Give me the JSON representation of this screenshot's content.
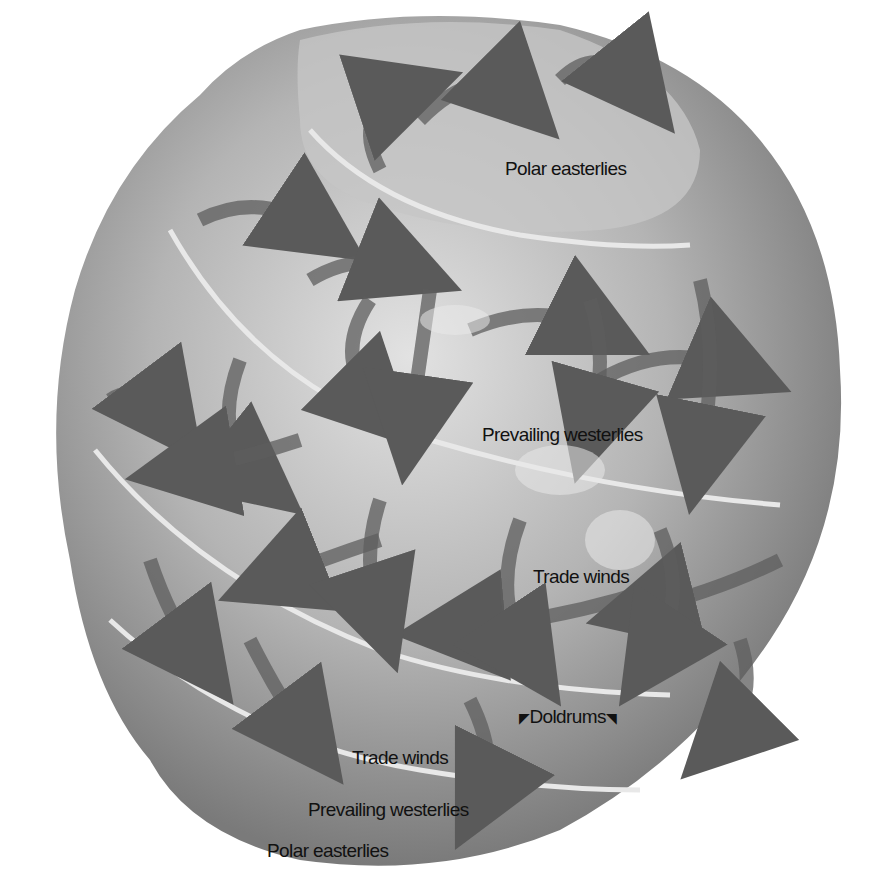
{
  "diagram": {
    "colors": {
      "background": "#ffffff",
      "globe_light": "#d8d8d8",
      "globe_mid": "#a8a8a8",
      "globe_dark": "#6e6e6e",
      "arrow": "#555555",
      "band_line": "#e6e6e6",
      "label_text": "#111111"
    },
    "labels": {
      "polar_easterlies_north": "Polar easterlies",
      "prevailing_westerlies_north": "Prevailing westerlies",
      "trade_winds_north": "Trade winds",
      "doldrums": "Doldrums",
      "trade_winds_south": "Trade winds",
      "prevailing_westerlies_south": "Prevailing westerlies",
      "polar_easterlies_south": "Polar easterlies"
    },
    "icons": {
      "doldrums_left": "◤",
      "doldrums_right": "◥"
    }
  }
}
